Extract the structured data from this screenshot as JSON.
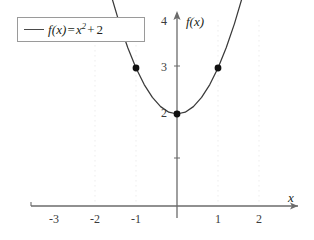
{
  "figure": {
    "background_color": "#ffffff",
    "curve_color": "#3a3a3a",
    "axis_color": "#6b6b6b",
    "grid_color": "#ededed",
    "marker_color": "#111111",
    "legend_border_color": "#9a9a9a"
  },
  "legend": {
    "entries": [
      {
        "swatch": "line-swatch",
        "label": "f(x) = x2 + 2",
        "label_fn": "f",
        "label_arg": "(x)",
        "label_eq": "=",
        "label_var": "x",
        "label_exp": "2",
        "label_plus": "+",
        "label_const": "2"
      }
    ]
  },
  "axes": {
    "x_label": "x",
    "y_label": "f(x)",
    "x_label_icon": "x-axis-arrow-icon",
    "y_label_icon": "y-axis-arrow-icon"
  },
  "chart_data": {
    "type": "line",
    "title": "",
    "subtitle": "",
    "xlabel": "x",
    "ylabel": "f(x)",
    "function": "f(x) = x^2 + 2",
    "xlim": [
      -3.4,
      2.6
    ],
    "ylim": [
      -0.45,
      5.1
    ],
    "grid": true,
    "grid_axis": "x",
    "legend_position": "top-left",
    "xticks": [
      -3,
      -2,
      -1,
      1,
      2
    ],
    "xticklabels": [
      "-3",
      "-2",
      "-1",
      "1",
      "2"
    ],
    "yticks": [
      2,
      3,
      4
    ],
    "yticklabels": [
      "2",
      "3",
      "4"
    ],
    "series": [
      {
        "name": "f(x) = x2 + 2",
        "type": "line",
        "color": "#3a3a3a",
        "x": [
          -1.72,
          -1.6,
          -1.4,
          -1.2,
          -1.0,
          -0.8,
          -0.6,
          -0.4,
          -0.2,
          0.0,
          0.2,
          0.4,
          0.6,
          0.8,
          1.0,
          1.2,
          1.4,
          1.6,
          1.74
        ],
        "y": [
          4.96,
          4.56,
          3.96,
          3.44,
          3.0,
          2.64,
          2.36,
          2.16,
          2.04,
          2.0,
          2.04,
          2.16,
          2.36,
          2.64,
          3.0,
          3.44,
          3.96,
          4.56,
          5.03
        ]
      }
    ],
    "markers": [
      {
        "name": "point-left",
        "x": -1,
        "y": 3,
        "label": ""
      },
      {
        "name": "point-vertex",
        "x": 0,
        "y": 2,
        "label": ""
      },
      {
        "name": "point-right",
        "x": 1,
        "y": 3,
        "label": ""
      }
    ],
    "gridlines_x": [
      -2,
      -1,
      1,
      2
    ]
  }
}
